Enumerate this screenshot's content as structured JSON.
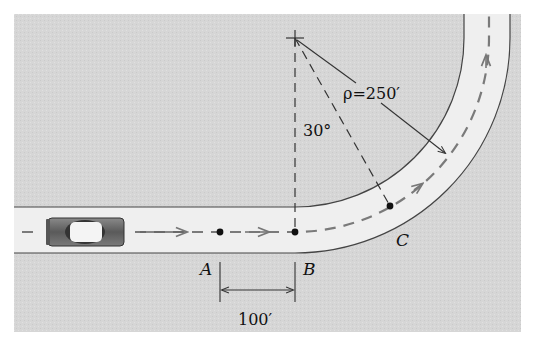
{
  "figure": {
    "labels": {
      "point_a": "A",
      "point_b": "B",
      "point_c": "C",
      "angle": "30°",
      "radius": "ρ=250′",
      "distance_ab": "100′"
    },
    "colors": {
      "background": "#d9d9d9",
      "road": "#f0f0f0",
      "ink": "#222222",
      "path_dash": "#777777",
      "car_body": "#6a6a6a"
    },
    "icons": {
      "car": "car-icon",
      "center_mark": "crosshair-icon"
    }
  }
}
